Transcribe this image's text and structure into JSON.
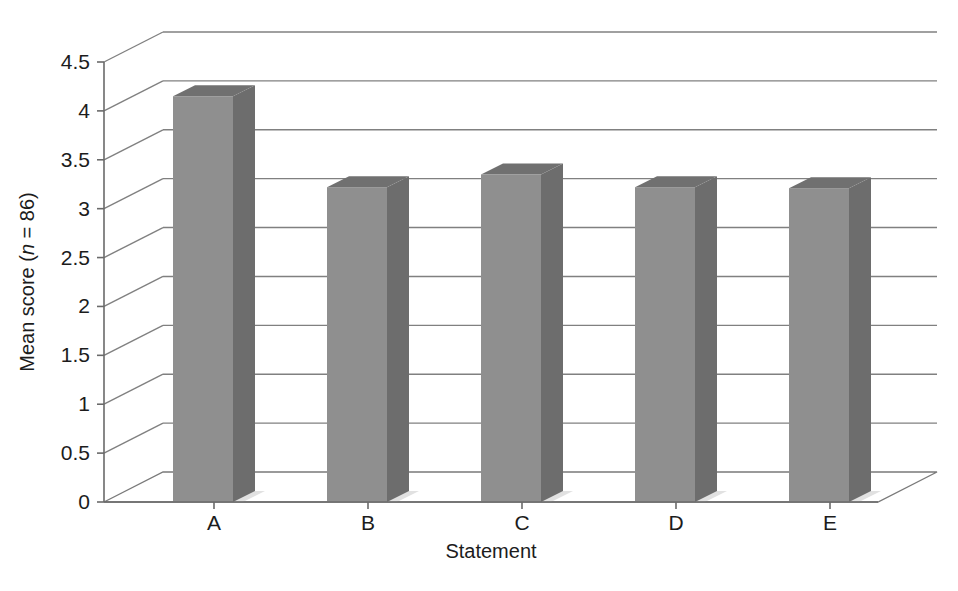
{
  "chart_data": {
    "type": "bar",
    "title": "",
    "subtitle": "",
    "xlabel": "Statement",
    "ylabel": "Mean score (n = 86)",
    "ylabel_parts": {
      "before": "Mean score (",
      "italic": "n",
      "after": " = 86)"
    },
    "categories": [
      "A",
      "B",
      "C",
      "D",
      "E"
    ],
    "values": [
      4.15,
      3.22,
      3.35,
      3.22,
      3.21
    ],
    "series": [
      {
        "name": "Mean score",
        "values": [
          4.15,
          3.22,
          3.35,
          3.22,
          3.21
        ]
      }
    ],
    "ylim": [
      0,
      4.5
    ],
    "ytick_values": [
      0,
      0.5,
      1,
      1.5,
      2,
      2.5,
      3,
      3.5,
      4,
      4.5
    ],
    "ytick_labels": [
      "0",
      "0.5",
      "1",
      "1.5",
      "2",
      "2.5",
      "3",
      "3.5",
      "4",
      "4.5"
    ],
    "grid": true,
    "grid_axis": "y",
    "legend": false,
    "legend_position": "none",
    "style": "3d-column",
    "annotations": [],
    "sample_size": 86,
    "colors": {
      "bar_front": "#8f8f8f",
      "bar_side": "#6d6d6d",
      "bar_top": "#707070",
      "gridline": "#808080",
      "axis": "#6a6a6a",
      "text": "#1c1c1c",
      "background": "#ffffff",
      "floor": "#ffffff",
      "shadow": "#c9c9c9"
    }
  },
  "layout": {
    "plot_left": 104,
    "plot_right": 878,
    "baseline_y": 502,
    "top_y": 62,
    "depth_dx": 59,
    "depth_dy": -30,
    "bar_width": 60,
    "bar_slot": 154,
    "first_bar_left": 173
  }
}
